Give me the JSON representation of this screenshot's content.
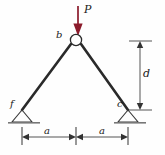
{
  "figure": {
    "type": "structural-truss-free-body-diagram",
    "background_color": "#fefefe",
    "load": {
      "label": "P",
      "color": "#8b1a2b",
      "direction": "down",
      "applied_at_joint": "b"
    },
    "joints": {
      "apex": {
        "label": "b",
        "marker": "open-circle",
        "x": 76,
        "y": 40
      },
      "left_support": {
        "label": "f",
        "type": "pin",
        "x": 22,
        "y": 110
      },
      "right_support": {
        "label": "c",
        "type": "pin",
        "x": 128,
        "y": 110
      }
    },
    "members": [
      {
        "name": "member-bf",
        "from": "b",
        "to": "f"
      },
      {
        "name": "member-bc",
        "from": "b",
        "to": "c"
      }
    ],
    "dimensions": [
      {
        "name": "dim-a-left",
        "label": "a",
        "orientation": "horizontal"
      },
      {
        "name": "dim-a-right",
        "label": "a",
        "orientation": "horizontal"
      },
      {
        "name": "dim-d",
        "label": "d",
        "orientation": "vertical"
      }
    ],
    "colors": {
      "member": "#2a2a2a",
      "dimension": "#555555",
      "label": "#1a1a1a",
      "load_arrow": "#8b1a2b",
      "ground": "#777777"
    }
  },
  "labels": {
    "load": "P",
    "apex": "b",
    "left_support": "f",
    "right_support": "c",
    "span_left": "a",
    "span_right": "a",
    "height": "d"
  }
}
